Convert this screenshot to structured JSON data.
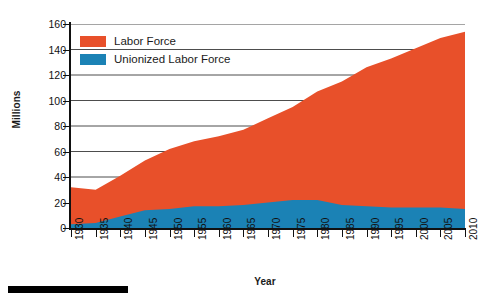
{
  "chart_data": {
    "type": "area",
    "stacked": true,
    "title": "",
    "xlabel": "Year",
    "ylabel": "Millions",
    "xlim": [
      1930,
      2010
    ],
    "ylim": [
      0,
      160
    ],
    "y_ticks": [
      0,
      20,
      40,
      60,
      80,
      100,
      120,
      140,
      160
    ],
    "x_ticks": [
      1930,
      1935,
      1940,
      1945,
      1950,
      1955,
      1960,
      1965,
      1970,
      1975,
      1980,
      1985,
      1990,
      1995,
      2000,
      2005,
      2010
    ],
    "grid": true,
    "legend_position": "top-left",
    "x": [
      1930,
      1935,
      1940,
      1945,
      1950,
      1955,
      1960,
      1965,
      1970,
      1975,
      1980,
      1985,
      1990,
      1995,
      2000,
      2005,
      2010
    ],
    "series": [
      {
        "name": "Unionized Labor Force",
        "color": "#1b82b5",
        "values": [
          3,
          4,
          9,
          14,
          15,
          17,
          17,
          18,
          20,
          22,
          22,
          18,
          17,
          16,
          16,
          16,
          15
        ]
      },
      {
        "name": "Labor Force",
        "color": "#e8502a",
        "values": [
          32,
          30,
          41,
          53,
          62,
          68,
          72,
          77,
          86,
          95,
          107,
          115,
          126,
          133,
          141,
          149,
          154
        ]
      }
    ]
  },
  "axes": {
    "y_title": "Millions",
    "x_title": "Year",
    "y_tick_labels": [
      "0",
      "20",
      "40",
      "60",
      "80",
      "100",
      "120",
      "140",
      "160"
    ],
    "x_tick_labels": [
      "1930",
      "1935",
      "1940",
      "1945",
      "1950",
      "1955",
      "1960",
      "1965",
      "1970",
      "1975",
      "1980",
      "1985",
      "1990",
      "1995",
      "2000",
      "2005",
      "2010"
    ]
  },
  "legend": {
    "items": [
      {
        "label": "Labor Force",
        "color": "#e8502a"
      },
      {
        "label": "Unionized Labor Force",
        "color": "#1b82b5"
      }
    ]
  },
  "colors": {
    "labor_force": "#e8502a",
    "unionized": "#1b82b5",
    "axis": "#111111",
    "grid": "#4d4d4d",
    "background": "#ffffff"
  }
}
